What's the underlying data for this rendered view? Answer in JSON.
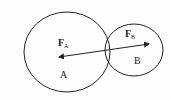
{
  "diagram": {
    "bodies": [
      {
        "id": "A",
        "label": "A",
        "cx": 67,
        "cy": 52,
        "rx": 43,
        "ry": 40
      },
      {
        "id": "B",
        "label": "B",
        "cx": 134,
        "cy": 50,
        "rx": 29,
        "ry": 26
      }
    ],
    "forces": [
      {
        "id": "FA",
        "label": "F",
        "subscript": "A",
        "x": 60,
        "y": 45
      },
      {
        "id": "FB",
        "label": "F",
        "subscript": "B",
        "x": 126,
        "y": 36
      }
    ],
    "line": {
      "x1": 59,
      "y1": 57,
      "x2": 149,
      "y2": 44
    },
    "colors": {
      "stroke": "#222222",
      "background": "#fdfdfd"
    }
  }
}
